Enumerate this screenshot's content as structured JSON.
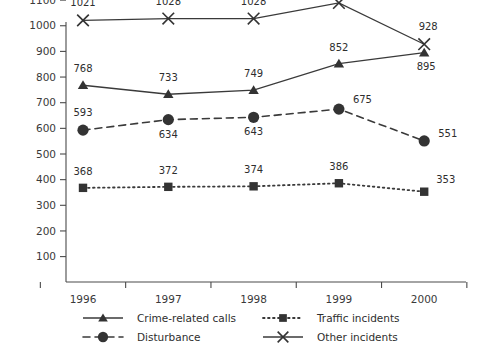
{
  "chart_data": {
    "type": "line",
    "title": "",
    "xlabel": "",
    "ylabel": "",
    "categories": [
      "1996",
      "1997",
      "1998",
      "1999",
      "2000"
    ],
    "ylim": [
      0,
      1100
    ],
    "yticks": [
      100,
      200,
      300,
      400,
      500,
      600,
      700,
      800,
      900,
      1000,
      1100
    ],
    "grid": false,
    "legend_position": "bottom",
    "series": [
      {
        "name": "Crime-related calls",
        "marker": "triangle",
        "linestyle": "solid",
        "values": [
          768,
          733,
          749,
          852,
          895
        ],
        "labels": [
          "768",
          "733",
          "749",
          "852",
          "895"
        ]
      },
      {
        "name": "Disturbance",
        "marker": "circle",
        "linestyle": "dashed",
        "values": [
          593,
          634,
          643,
          675,
          551
        ],
        "labels": [
          "593",
          "634",
          "643",
          "675",
          "551"
        ]
      },
      {
        "name": "Traffic incidents",
        "marker": "square",
        "linestyle": "dotted",
        "values": [
          368,
          372,
          374,
          386,
          353
        ],
        "labels": [
          "368",
          "372",
          "374",
          "386",
          "353"
        ]
      },
      {
        "name": "Other incidents",
        "marker": "x",
        "linestyle": "solid",
        "values": [
          1021,
          1028,
          1028,
          1089,
          928
        ],
        "labels": [
          "1021",
          "1028",
          "1028",
          "1089",
          "928"
        ]
      }
    ]
  },
  "axes": {
    "y_tick_labels": [
      "1100",
      "1000",
      "900",
      "800",
      "700",
      "600",
      "500",
      "400",
      "300",
      "200",
      "100"
    ],
    "x_tick_labels": [
      "1996",
      "1997",
      "1998",
      "1999",
      "2000"
    ]
  },
  "legend": {
    "entries": [
      {
        "label": "Crime-related calls",
        "marker": "triangle",
        "linestyle": "solid"
      },
      {
        "label": "Traffic incidents",
        "marker": "square",
        "linestyle": "dotted"
      },
      {
        "label": "Disturbance",
        "marker": "circle",
        "linestyle": "dashed"
      },
      {
        "label": "Other incidents",
        "marker": "x",
        "linestyle": "solid"
      }
    ]
  },
  "colors": {
    "ink": "#333333",
    "axis": "#4a4a4a",
    "background": "#ffffff"
  }
}
